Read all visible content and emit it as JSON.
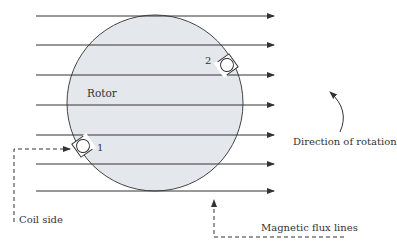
{
  "diagram": {
    "rotor_label": "Rotor",
    "coil_labels": {
      "one": "1",
      "two": "2"
    },
    "annotations": {
      "coil_side": "Coil side",
      "direction_of_rotation": "Direction of rotation",
      "magnetic_flux_lines": "Magnetic flux lines"
    },
    "flux_line_count": 7,
    "colors": {
      "rotor_fill": "#e4e7ec",
      "line": "#333333",
      "background": "#ffffff"
    }
  }
}
